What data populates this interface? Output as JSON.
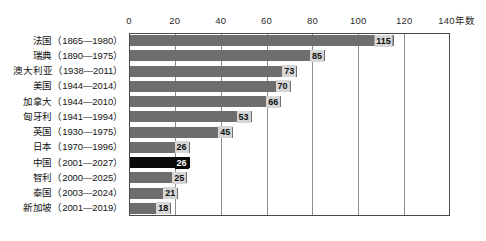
{
  "chart_data": {
    "type": "bar",
    "orientation": "horizontal",
    "title": "",
    "subtitle": "",
    "xlabel": "年数",
    "ylabel": "",
    "xlim": [
      0,
      140
    ],
    "grid": true,
    "legend": false,
    "axis_unit_label": "年数",
    "x_ticks": [
      0,
      20,
      40,
      60,
      80,
      100,
      120,
      140
    ],
    "x_tick_labels": [
      "0",
      "20",
      "40",
      "60",
      "80",
      "100",
      "120",
      "140"
    ],
    "categories": [
      "法国（1865—1980）",
      "瑞典（1890—1975）",
      "澳大利亚（1938—2011）",
      "美国（1944—2014）",
      "加拿大（1944—2010）",
      "匈牙利（1941—1994）",
      "英国（1930—1975）",
      "日本（1970—1996）",
      "中国（2001—2027）",
      "智利（2000—2025）",
      "泰国（2003—2024）",
      "新加坡（2001—2019）"
    ],
    "values": [
      115,
      85,
      73,
      70,
      66,
      53,
      45,
      26,
      26,
      25,
      21,
      18
    ],
    "highlight_index": 8,
    "colors": {
      "bar": "#6e6e6e",
      "bar_highlight": "#0a0a0a",
      "value_label_bg": "#d6d6d6",
      "value_label_text": "#111111",
      "value_label_text_highlight": "#ffffff",
      "frame": "#4a4a4a",
      "gridline": "#8d8d8d",
      "background": "#ffffff"
    }
  }
}
